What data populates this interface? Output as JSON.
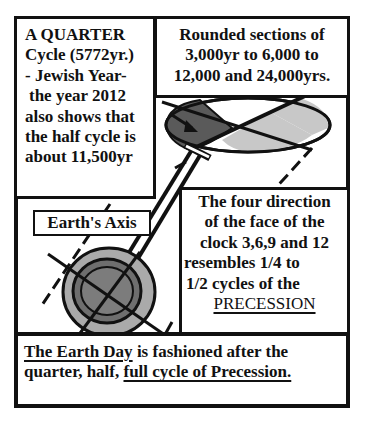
{
  "top_left_box": {
    "lines": [
      "A QUARTER",
      "Cycle (5772yr.)",
      "- Jewish Year-",
      "the year 2012",
      "also shows that",
      "the half cycle is",
      "about 11,500yr"
    ]
  },
  "top_right_box": {
    "lines": [
      "Rounded sections of",
      "3,000yr to 6,000 to",
      "12,000 and 24,000yrs."
    ]
  },
  "right_middle_box": {
    "lines": [
      "The four direction",
      "of the face of the",
      "clock 3,6,9 and 12",
      "resembles 1/4 to",
      "1/2 cycles of the"
    ],
    "emphasis": "PRECESSION"
  },
  "axis_label": "Earth's Axis",
  "bottom_box": {
    "line1_underlined": "The Earth Day",
    "line1_rest": " is fashioned after the",
    "line2_plain": "quarter, half, ",
    "line2_underlined": "full cycle of Precession."
  },
  "colors": {
    "ink": "#111111",
    "dark_gray": "#5a5a5a",
    "mid_gray": "#8a8a8a",
    "light_gray": "#c8c8c8",
    "background": "#ffffff"
  }
}
